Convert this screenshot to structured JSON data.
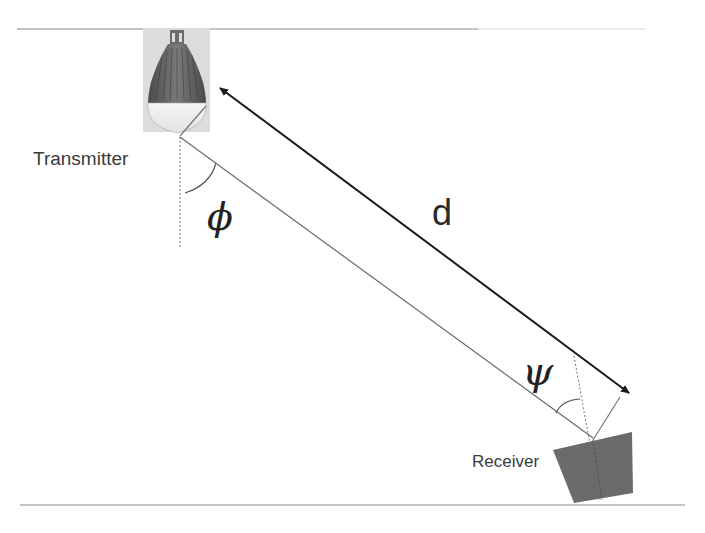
{
  "diagram": {
    "type": "optical wireless link geometry",
    "labels": {
      "transmitter": "Transmitter",
      "receiver": "Receiver",
      "distance": "d",
      "irradiance_angle": "ϕ",
      "incidence_angle": "ψ"
    },
    "components": [
      {
        "id": "transmitter",
        "kind": "LED bulb",
        "label": "Transmitter"
      },
      {
        "id": "receiver",
        "kind": "photodetector",
        "label": "Receiver"
      }
    ],
    "relations": [
      {
        "from": "transmitter",
        "to": "receiver",
        "kind": "line-of-sight ray"
      },
      {
        "from": "transmitter",
        "to": "receiver",
        "kind": "distance arrow (double-headed)",
        "label": "d"
      },
      {
        "at": "transmitter",
        "kind": "angle between vertical and ray",
        "label": "ϕ"
      },
      {
        "at": "receiver",
        "kind": "angle between receiver normal and ray",
        "label": "ψ"
      }
    ],
    "colors": {
      "line": "#555555",
      "arrow": "#1a1a1a",
      "receiver_fill": "#6b6b6b",
      "bulb_bg": "#dcdcdc"
    }
  }
}
